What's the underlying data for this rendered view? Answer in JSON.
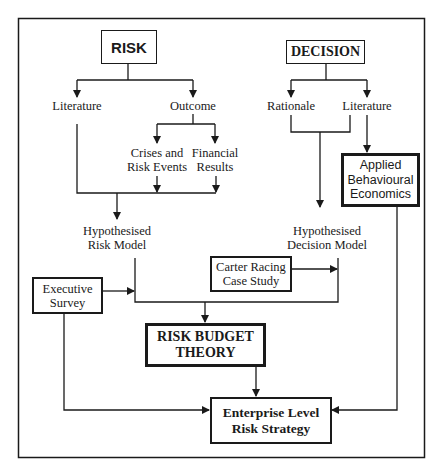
{
  "diagram": {
    "type": "flowchart",
    "nodes": {
      "risk": "RISK",
      "decision": "DECISION",
      "risk_literature": "Literature",
      "outcome": "Outcome",
      "crises": "Crises and\nRisk Events",
      "financial": "Financial\nResults",
      "hyp_risk": "Hypothesised\nRisk Model",
      "rationale": "Rationale",
      "decision_literature": "Literature",
      "abe": "Applied\nBehavioural\nEconomics",
      "hyp_decision": "Hypothesised\nDecision Model",
      "exec_survey": "Executive\nSurvey",
      "carter": "Carter Racing\nCase Study",
      "rbt": "RISK BUDGET\nTHEORY",
      "enterprise": "Enterprise Level\nRisk Strategy"
    },
    "edges": [
      [
        "RISK",
        "Literature"
      ],
      [
        "RISK",
        "Outcome"
      ],
      [
        "Outcome",
        "Crises and Risk Events"
      ],
      [
        "Outcome",
        "Financial Results"
      ],
      [
        "Literature + Crises and Risk Events + Financial Results",
        "Hypothesised Risk Model"
      ],
      [
        "DECISION",
        "Rationale"
      ],
      [
        "DECISION",
        "Literature"
      ],
      [
        "Rationale + Literature",
        "Hypothesised Decision Model"
      ],
      [
        "Literature",
        "Applied Behavioural Economics"
      ],
      [
        "Executive Survey",
        "Hypothesised Risk Model path"
      ],
      [
        "Carter Racing Case Study",
        "Hypothesised Decision Model path"
      ],
      [
        "Hypothesised Risk Model + Hypothesised Decision Model",
        "RISK BUDGET THEORY"
      ],
      [
        "RISK BUDGET THEORY",
        "Enterprise Level Risk Strategy"
      ],
      [
        "Executive Survey",
        "Enterprise Level Risk Strategy"
      ],
      [
        "Applied Behavioural Economics",
        "Enterprise Level Risk Strategy"
      ]
    ],
    "colors": {
      "line": "#1a1a1a",
      "background": "#ffffff"
    }
  }
}
